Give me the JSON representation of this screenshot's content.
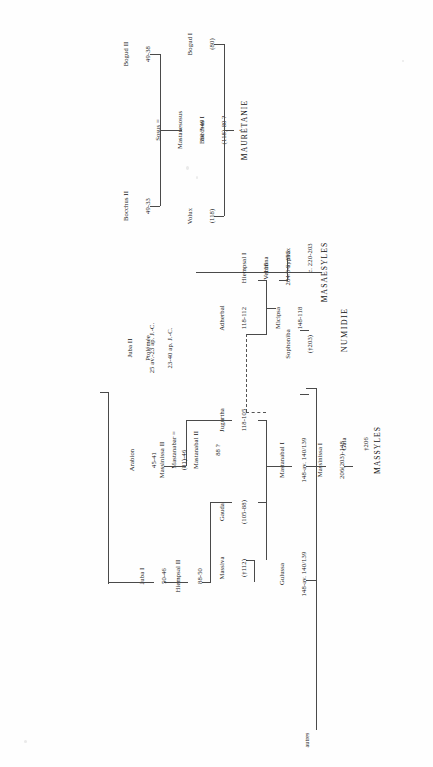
{
  "document": {
    "type": "genealogical-chart",
    "orientation": "rotated-90-ccw",
    "language": "fr"
  },
  "headings": {
    "mauretanie": "MAURÉTANIE",
    "numidie": "NUMIDIE",
    "masaesyles": "MASAESYLES",
    "massyles": "MASSYLES",
    "autres": "autres"
  },
  "mauretanie_nodes": [
    {
      "id": "bocchus_i",
      "name": "Bocchus I",
      "dates": "(118)-80 ?"
    },
    {
      "id": "bogud_i",
      "name": "Bogud I",
      "dates": "(80)"
    },
    {
      "id": "volux",
      "name": "Volux",
      "dates": "(118)"
    },
    {
      "id": "sosus",
      "name": "Sosus =",
      "dates2": "Mastanesosus",
      "dates": "80 ?-49"
    },
    {
      "id": "bogud_ii",
      "name": "Bogud II",
      "dates": "49-38"
    },
    {
      "id": "bocchus_ii",
      "name": "Bocchus II",
      "dates": "49-33"
    }
  ],
  "masaesyles_nodes": [
    {
      "id": "syphax",
      "name": "Syphax",
      "dates": "c. 220-203"
    },
    {
      "id": "sophoniba",
      "name": "Sophoniba",
      "dates": "(†203)"
    },
    {
      "id": "vermina",
      "name": "Vermina",
      "dates": "204/3-c. 195"
    }
  ],
  "massyles_nodes": [
    {
      "id": "gaia",
      "name": "Gaia",
      "dates": "†206"
    },
    {
      "id": "massinissa_i",
      "name": "Massinissa I",
      "dates": "206(203)-148"
    },
    {
      "id": "gulussa",
      "name": "Gulussa",
      "dates": "148-av. 140/139"
    },
    {
      "id": "mastanabal_i",
      "name": "Mastanabal I",
      "dates": "148-av. 140/139"
    },
    {
      "id": "micipsa",
      "name": "Micipsa",
      "dates": "148-118"
    },
    {
      "id": "massiva",
      "name": "Massiva",
      "dates": "(†112)"
    },
    {
      "id": "jugurtha",
      "name": "Jugurtha",
      "dates": "118-105"
    },
    {
      "id": "hiempsal_i",
      "name": "Hiempsal I",
      "dates": "118"
    },
    {
      "id": "adherbal",
      "name": "Adherbal",
      "dates": "118-112"
    },
    {
      "id": "gauda",
      "name": "Gauda",
      "dates": "(105-88)"
    },
    {
      "id": "mastanabar",
      "name": "Mastanabar =",
      "dates2": "Mastanabal II",
      "dates": "88 ?"
    },
    {
      "id": "hiempsal_ii",
      "name": "Hiempsal II",
      "dates": "88-50"
    },
    {
      "id": "massinissa_ii",
      "name": "Massinissa II",
      "dates": "(81)-46"
    },
    {
      "id": "juba_i",
      "name": "Juba I",
      "dates": "50-46"
    },
    {
      "id": "arabion",
      "name": "Arabion",
      "dates": "45-41"
    },
    {
      "id": "juba_ii",
      "name": "Juba II",
      "dates": "25 av.-23 ap. J.-C."
    },
    {
      "id": "ptolemee",
      "name": "Ptolémée",
      "dates": "23-40 ap. J.-C."
    }
  ]
}
